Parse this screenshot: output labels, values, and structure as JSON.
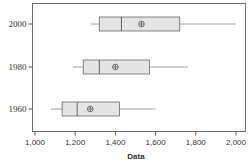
{
  "chart_data": {
    "type": "boxplot",
    "orientation": "horizontal",
    "title": "",
    "xlabel": "Data",
    "ylabel": "",
    "xlim": [
      980,
      2050
    ],
    "x_ticks": [
      1000,
      1200,
      1400,
      1600,
      1800,
      2000
    ],
    "x_tick_labels": [
      "1,000",
      "1,200",
      "1,400",
      "1,600",
      "1,800",
      "2,000"
    ],
    "categories": [
      "2000",
      "1980",
      "1960"
    ],
    "series": [
      {
        "name": "2000",
        "whisker_low": 1280,
        "q1": 1320,
        "median": 1430,
        "mean": 1530,
        "q3": 1720,
        "whisker_high": 2000
      },
      {
        "name": "1980",
        "whisker_low": 1190,
        "q1": 1240,
        "median": 1320,
        "mean": 1400,
        "q3": 1570,
        "whisker_high": 1760
      },
      {
        "name": "1960",
        "whisker_low": 1080,
        "q1": 1135,
        "median": 1210,
        "mean": 1275,
        "q3": 1420,
        "whisker_high": 1600
      }
    ],
    "mean_marker": "circle-plus",
    "grid": false,
    "legend": "none"
  },
  "colors": {
    "box_fill": "#e4e4e4",
    "box_stroke": "#666666",
    "frame": "#6e6e6e",
    "text": "#333333"
  }
}
